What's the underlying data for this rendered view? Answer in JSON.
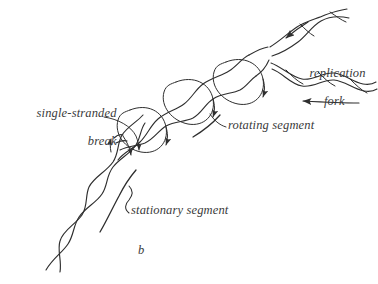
{
  "figure": {
    "panel_label": "b",
    "background_color": "#ffffff",
    "ink_color": "#2e2e2e",
    "text_color": "#3a3a3a",
    "labels": {
      "single_stranded_break": {
        "line1": "single-stranded",
        "line2": "break"
      },
      "replication_fork": {
        "line1": "replication",
        "line2": "fork"
      },
      "rotating_segment": "rotating segment",
      "stationary_segment": "stationary segment"
    }
  }
}
